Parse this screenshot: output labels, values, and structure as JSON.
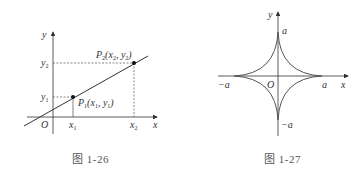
{
  "figures": [
    {
      "caption": "图 1-26",
      "labels": {
        "y_axis": "y",
        "x_axis": "x",
        "origin": "O",
        "y1": "y",
        "y1_sub": "1",
        "y2": "y",
        "y2_sub": "2",
        "x1": "x",
        "x1_sub": "1",
        "x2": "x",
        "x2_sub": "2",
        "p1_main": "P",
        "p1_sub": "1",
        "p1_coords_open": "(x",
        "p1_coords_x_sub": "1",
        "p1_coords_mid": ", y",
        "p1_coords_y_sub": "1",
        "p1_coords_close": ")",
        "p2_main": "P",
        "p2_sub": "2",
        "p2_coords_open": "(x",
        "p2_coords_x_sub": "2",
        "p2_coords_mid": ", y",
        "p2_coords_y_sub": "2",
        "p2_coords_close": ")"
      }
    },
    {
      "caption": "图 1-27",
      "labels": {
        "y_axis": "y",
        "x_axis": "x",
        "origin": "O",
        "top": "a",
        "bottom": "−a",
        "left": "−a",
        "right": "a"
      }
    }
  ]
}
